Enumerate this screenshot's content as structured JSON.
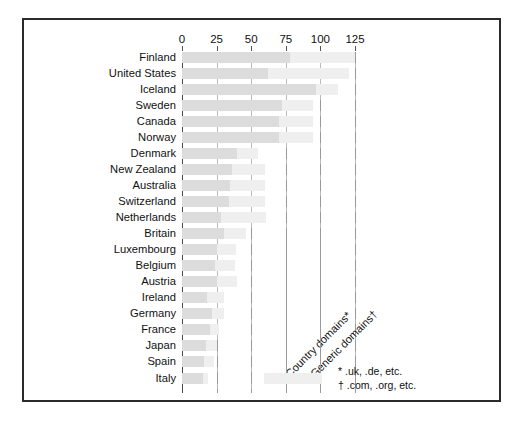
{
  "chart_data": {
    "type": "bar",
    "orientation": "horizontal",
    "stacked": true,
    "title": "",
    "subtitle": "",
    "xlabel": "",
    "ylabel": "",
    "xlim": [
      0,
      125
    ],
    "xticks": [
      0,
      25,
      50,
      75,
      100,
      125
    ],
    "xtick_labels": [
      "0",
      "25",
      "50",
      "75",
      "100",
      "125"
    ],
    "grid": "vertical",
    "legend_position": "inside-bottom-right",
    "categories": [
      "Finland",
      "United States",
      "Iceland",
      "Sweden",
      "Canada",
      "Norway",
      "Denmark",
      "New Zealand",
      "Australia",
      "Switzerland",
      "Netherlands",
      "Britain",
      "Luxembourg",
      "Belgium",
      "Austria",
      "Ireland",
      "Germany",
      "France",
      "Japan",
      "Spain",
      "Italy"
    ],
    "series": [
      {
        "name": "Country domains*",
        "color": "#dcdcdc",
        "values": [
          78,
          62,
          97,
          72,
          70,
          70,
          40,
          36,
          35,
          34,
          28,
          30,
          25,
          24,
          25,
          18,
          22,
          20,
          17,
          16,
          15
        ]
      },
      {
        "name": "Generic domains†",
        "color": "#efefef",
        "values": [
          47,
          59,
          16,
          23,
          25,
          25,
          15,
          24,
          25,
          26,
          33,
          16,
          14,
          14,
          15,
          12,
          8,
          7,
          8,
          7,
          4
        ]
      }
    ],
    "totals": [
      125,
      121,
      113,
      95,
      95,
      95,
      55,
      60,
      60,
      60,
      61,
      46,
      39,
      38,
      40,
      30,
      30,
      27,
      25,
      23,
      19
    ],
    "legend_entries": [
      "Country domains*",
      "Generic domains†"
    ],
    "footnotes": [
      "* .uk, .de, etc.",
      "† .com, .org, etc."
    ]
  },
  "axis": {
    "ticks": [
      {
        "label": "0",
        "value": 0
      },
      {
        "label": "25",
        "value": 25
      },
      {
        "label": "50",
        "value": 50
      },
      {
        "label": "75",
        "value": 75
      },
      {
        "label": "100",
        "value": 100
      },
      {
        "label": "125",
        "value": 125
      }
    ]
  },
  "annotations": {
    "country_label": "Country domains*",
    "generic_label": "Generic domains†",
    "footnote_country": "* .uk, .de, etc.",
    "footnote_generic": "† .com, .org, etc."
  }
}
